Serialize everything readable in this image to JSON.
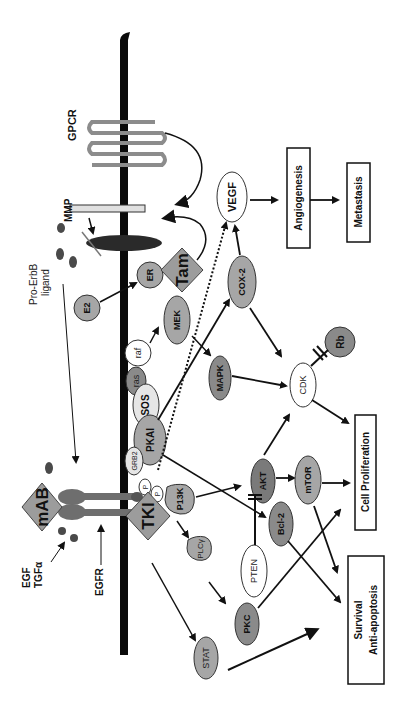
{
  "figure": {
    "type": "signaling-pathway-diagram",
    "orientation": "rotated-90-ccw"
  },
  "colors": {
    "membrane": "#0a0a0a",
    "node_gray": "#a6a6a6",
    "node_dark": "#7a7a7a",
    "node_light": "#e6e6e6",
    "node_white": "#ffffff",
    "drug_diamond": "#9c9c9c",
    "gpcr": "#8c8c8c",
    "receptor": "#6e6e6e",
    "ligand_dot": "#4a4a4a"
  },
  "labels": {
    "gpcr": "GPCR",
    "mmp": "MMP",
    "pro_erbb_line1": "Pro-ErbB",
    "pro_erbb_line2": "ligand",
    "egf": "EGF",
    "tgfa": "TGFα",
    "egfr": "EGFR",
    "mab": "mAB",
    "tki": "TKI",
    "tam": "Tam"
  },
  "nodes": {
    "e2": "E2",
    "er": "ER",
    "mek": "MEK",
    "raf": "raf",
    "ras": "ras",
    "sos": "SOS",
    "pkai": "PKAI",
    "grb2": "GRB2",
    "p1": "P",
    "p2": "P",
    "p13k": "P13K",
    "plcg": "PLCγ",
    "vegf": "VEGF",
    "cox2": "COX-2",
    "mapk": "MAPK",
    "cdk": "CDK",
    "rb": "Rb",
    "akt": "AKT",
    "bcl2": "Bcl-2",
    "mtor": "mTOR",
    "pten": "PTEN",
    "pkc": "PKC",
    "stat": "STAT"
  },
  "outcomes": {
    "angiogenesis": "Angiogenesis",
    "metastasis": "Metastasis",
    "cell_proliferation": "Cell Proliferation",
    "survival_line1": "Survival",
    "survival_line2": "Anti-apoptosis"
  },
  "edges": [
    {
      "from": "GPCR",
      "to": "MMP",
      "type": "activation"
    },
    {
      "from": "Tam",
      "to": "MMP",
      "type": "activation"
    },
    {
      "from": "Pro-ErbB ligand",
      "to": "EGFR",
      "type": "activation"
    },
    {
      "from": "EGF/TGFα",
      "to": "EGFR",
      "type": "binding"
    },
    {
      "from": "E2",
      "to": "ER",
      "type": "activation"
    },
    {
      "from": "raf",
      "to": "MEK",
      "type": "activation"
    },
    {
      "from": "MEK",
      "to": "MAPK",
      "type": "activation"
    },
    {
      "from": "SOS",
      "to": "COX-2",
      "type": "activation"
    },
    {
      "from": "PKAI",
      "to": "VEGF",
      "type": "dotted"
    },
    {
      "from": "COX-2",
      "to": "VEGF",
      "type": "activation"
    },
    {
      "from": "COX-2",
      "to": "CDK",
      "type": "activation"
    },
    {
      "from": "MAPK",
      "to": "CDK",
      "type": "activation"
    },
    {
      "from": "Rb",
      "to": "CDK",
      "type": "inhibition"
    },
    {
      "from": "CDK",
      "to": "Cell Proliferation",
      "type": "activation"
    },
    {
      "from": "VEGF",
      "to": "Angiogenesis",
      "type": "activation"
    },
    {
      "from": "Angiogenesis",
      "to": "Metastasis",
      "type": "activation"
    },
    {
      "from": "P13K",
      "to": "AKT",
      "type": "activation"
    },
    {
      "from": "PKAI",
      "to": "Bcl-2",
      "type": "activation"
    },
    {
      "from": "P13K",
      "to": "PLCγ",
      "type": "activation"
    },
    {
      "from": "PLCγ",
      "to": "PKC",
      "type": "activation"
    },
    {
      "from": "PTEN",
      "to": "AKT",
      "type": "inhibition"
    },
    {
      "from": "AKT",
      "to": "CDK",
      "type": "activation"
    },
    {
      "from": "AKT",
      "to": "mTOR",
      "type": "activation"
    },
    {
      "from": "mTOR",
      "to": "Cell Proliferation",
      "type": "activation"
    },
    {
      "from": "mTOR",
      "to": "Survival",
      "type": "activation"
    },
    {
      "from": "Bcl-2",
      "to": "Survival",
      "type": "activation"
    },
    {
      "from": "PKC",
      "to": "Cell Proliferation",
      "type": "activation"
    },
    {
      "from": "TKI",
      "to": "STAT",
      "type": "activation"
    },
    {
      "from": "STAT",
      "to": "Survival",
      "type": "activation"
    }
  ]
}
